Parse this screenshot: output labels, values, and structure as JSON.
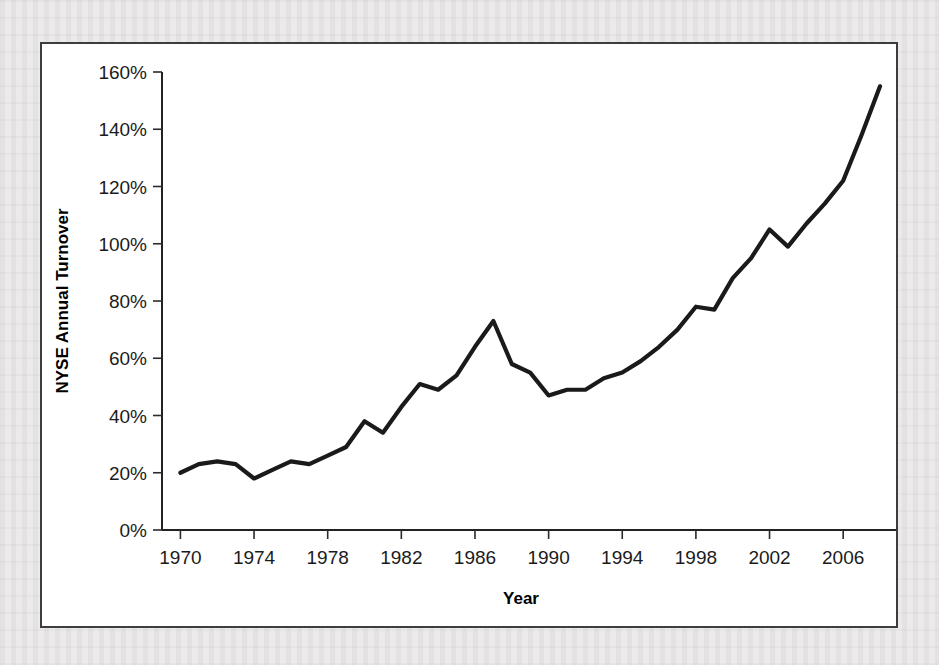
{
  "figure": {
    "frame_border_color": "#3d3d3d",
    "plot_background": "#ffffff",
    "page_background": "#eceaea"
  },
  "chart_data": {
    "type": "line",
    "title": "",
    "subtitle": "",
    "xlabel": "Year",
    "ylabel": "NYSE Annual Turnover",
    "xlim": [
      1969,
      2008
    ],
    "ylim": [
      0,
      160
    ],
    "grid": false,
    "legend": false,
    "legend_position": "none",
    "series_color": "#1a1a1a",
    "y_tick_labels": [
      "0%",
      "20%",
      "40%",
      "60%",
      "80%",
      "100%",
      "120%",
      "140%",
      "160%"
    ],
    "y_tick_values": [
      0,
      20,
      40,
      60,
      80,
      100,
      120,
      140,
      160
    ],
    "y_unit": "%",
    "x_tick_labels": [
      "1970",
      "1974",
      "1978",
      "1982",
      "1986",
      "1990",
      "1994",
      "1998",
      "2002",
      "2006"
    ],
    "x_tick_values": [
      1970,
      1974,
      1978,
      1982,
      1986,
      1990,
      1994,
      1998,
      2002,
      2006
    ],
    "x": [
      1970,
      1971,
      1972,
      1973,
      1974,
      1975,
      1976,
      1977,
      1978,
      1979,
      1980,
      1981,
      1982,
      1983,
      1984,
      1985,
      1986,
      1987,
      1988,
      1989,
      1990,
      1991,
      1992,
      1993,
      1994,
      1995,
      1996,
      1997,
      1998,
      1999,
      2000,
      2001,
      2002,
      2003,
      2004,
      2005,
      2006,
      2007,
      2008
    ],
    "values": [
      20,
      23,
      24,
      23,
      18,
      21,
      24,
      23,
      26,
      29,
      38,
      34,
      43,
      51,
      49,
      54,
      64,
      73,
      58,
      55,
      47,
      49,
      49,
      53,
      55,
      59,
      64,
      70,
      78,
      77,
      88,
      95,
      105,
      99,
      107,
      114,
      122,
      138,
      155
    ],
    "annotations": []
  },
  "geometry": {
    "plot_left": 120,
    "plot_right": 838,
    "plot_top": 28,
    "plot_bottom": 486
  }
}
